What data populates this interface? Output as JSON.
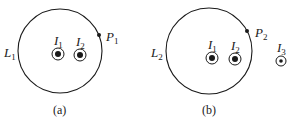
{
  "panels": [
    {
      "caption": "(a)",
      "loop": {
        "label": "L",
        "sub": "1"
      },
      "point": {
        "label": "P",
        "sub": "1"
      },
      "currents": [
        {
          "label": "I",
          "sub": "1",
          "direction": "out-of-page"
        },
        {
          "label": "I",
          "sub": "2",
          "direction": "out-of-page"
        }
      ]
    },
    {
      "caption": "(b)",
      "loop": {
        "label": "L",
        "sub": "2"
      },
      "point": {
        "label": "P",
        "sub": "2"
      },
      "currents": [
        {
          "label": "I",
          "sub": "1",
          "direction": "out-of-page"
        },
        {
          "label": "I",
          "sub": "2",
          "direction": "out-of-page"
        },
        {
          "label": "I",
          "sub": "3",
          "direction": "out-of-page"
        }
      ]
    }
  ],
  "colors": {
    "stroke": "#1a1a1a",
    "background": "#ffffff"
  }
}
